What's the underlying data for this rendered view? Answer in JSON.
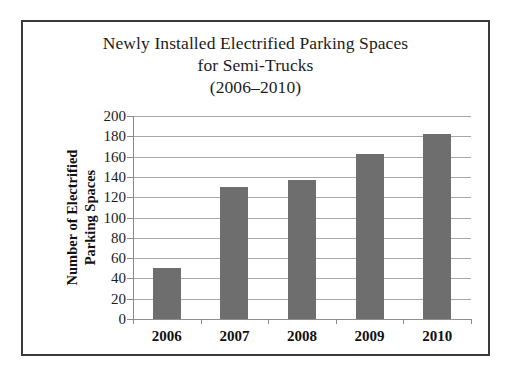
{
  "chart_data": {
    "type": "bar",
    "title_lines": [
      "Newly Installed Electrified Parking Spaces",
      "for Semi-Trucks",
      "(2006–2010)"
    ],
    "categories": [
      "2006",
      "2007",
      "2008",
      "2009",
      "2010"
    ],
    "values": [
      50,
      130,
      137,
      163,
      182
    ],
    "xlabel": "",
    "ylabel": "Number of Electrified Parking Spaces",
    "ylabel_lines": [
      "Number of Electrified",
      "Parking Spaces"
    ],
    "ylim": [
      0,
      200
    ],
    "ytick_labels": [
      "0",
      "20",
      "40",
      "60",
      "80",
      "100",
      "120",
      "140",
      "160",
      "180",
      "200"
    ],
    "ytick_values": [
      0,
      20,
      40,
      60,
      80,
      100,
      120,
      140,
      160,
      180,
      200
    ],
    "ytick_step": 20,
    "grid": true,
    "legend": false,
    "legend_position": "none",
    "colors": {
      "bar_fill": "#6e6e6e",
      "gridline": "#a8a8a8",
      "axis_line": "#8a8a8a",
      "text": "#1c1c1c",
      "frame_border": "#3a3a3a",
      "background": "#ffffff"
    }
  }
}
